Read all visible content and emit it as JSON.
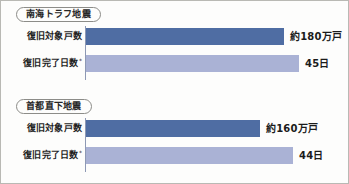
{
  "chart_data": {
    "type": "bar",
    "title": "",
    "orientation": "horizontal",
    "grid": false,
    "legend": false,
    "panels": [
      {
        "name": "nankai-trough-earthquake",
        "header": "南海トラフ地震",
        "categories": [
          "復旧対象戸数",
          "復旧完了日数"
        ],
        "series": [
          {
            "name": "復旧対象戸数",
            "label": "復旧対象戸数",
            "note": "",
            "value": 1800000,
            "value_label": "約180万戸",
            "unit": "戸",
            "bar_width_px": 198,
            "color": "#4f6da3",
            "style": "dark"
          },
          {
            "name": "復旧完了日数",
            "label": "復旧完了日数",
            "note": "*",
            "value": 45,
            "value_label": "45日",
            "unit": "日",
            "bar_width_px": 213,
            "color": "#aab2d5",
            "style": "light"
          }
        ]
      },
      {
        "name": "tokyo-inland-earthquake",
        "header": "首都直下地震",
        "categories": [
          "復旧対象戸数",
          "復旧完了日数"
        ],
        "series": [
          {
            "name": "復旧対象戸数",
            "label": "復旧対象戸数",
            "note": "",
            "value": 1600000,
            "value_label": "約160万戸",
            "unit": "戸",
            "bar_width_px": 174,
            "color": "#4f6da3",
            "style": "dark"
          },
          {
            "name": "復旧完了日数",
            "label": "復旧完了日数",
            "note": "*",
            "value": 44,
            "value_label": "44日",
            "unit": "日",
            "bar_width_px": 207,
            "color": "#aab2d5",
            "style": "light"
          }
        ]
      }
    ],
    "colors": {
      "bar_dark": "#4f6da3",
      "bar_light": "#aab2d5",
      "axis": "#8e99b4",
      "border": "#b9b9b4",
      "text": "#1f1f1f",
      "background": "#fdfdfc"
    }
  }
}
